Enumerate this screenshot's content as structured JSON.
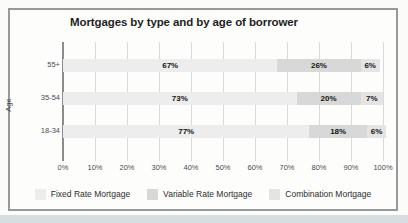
{
  "title": "Mortgages by type and by age of borrower",
  "colors": {
    "fixed": "#ededed",
    "variable": "#d8d8d8",
    "combination": "#e4e4e4",
    "frame_border": "#97999b",
    "grid": "#d8d9da",
    "axis": "#8a8c8e",
    "value_text": "#141414",
    "muted_text": "#4c4c4c",
    "scan_strip": "#d7dde1"
  },
  "chart_data": {
    "type": "bar",
    "orientation": "horizontal",
    "stacked": true,
    "title": "Mortgages by type and by age of borrower",
    "ylabel": "Age",
    "xlabel": "",
    "categories": [
      "55+",
      "35-54",
      "18-34"
    ],
    "series": [
      {
        "name": "Fixed Rate Mortgage",
        "color_key": "fixed",
        "values": [
          67,
          73,
          77
        ]
      },
      {
        "name": "Variable Rate Mortgage",
        "color_key": "variable",
        "values": [
          26,
          20,
          18
        ]
      },
      {
        "name": "Combination Mortgage",
        "color_key": "combination",
        "values": [
          6,
          7,
          6
        ]
      }
    ],
    "x_ticks": [
      "0%",
      "10%",
      "20%",
      "30%",
      "40%",
      "50%",
      "60%",
      "70%",
      "80%",
      "90%",
      "100%"
    ],
    "xlim": [
      0,
      100
    ],
    "value_suffix": "%",
    "grid": true,
    "legend_position": "bottom"
  }
}
